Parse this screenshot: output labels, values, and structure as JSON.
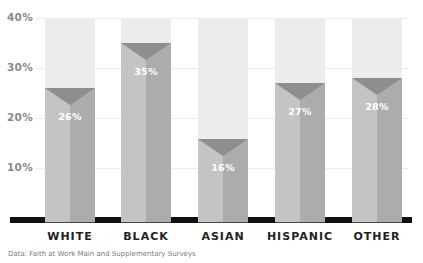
{
  "chart_data": {
    "type": "bar",
    "title": "",
    "categories": [
      "WHITE",
      "BLACK",
      "ASIAN",
      "HISPANIC",
      "OTHER"
    ],
    "values": [
      26,
      35,
      16,
      27,
      28
    ],
    "value_labels": [
      "26%",
      "35%",
      "16%",
      "27%",
      "28%"
    ],
    "xlabel": "",
    "ylabel": "",
    "ylim": [
      0,
      40
    ],
    "yticks": [
      "10%",
      "20%",
      "30%",
      "40%"
    ],
    "grid": true,
    "legend": null,
    "source": "Data: Faith at Work Main and Supplementary Surveys"
  },
  "colors": {
    "bar_background": "#ececec",
    "bar_left": "#c4c4c4",
    "bar_right": "#acacac",
    "bar_notch": "#8e8e8e",
    "baseline": "#111111",
    "tick_text": "#8a8a8a",
    "category_text": "#222222"
  }
}
